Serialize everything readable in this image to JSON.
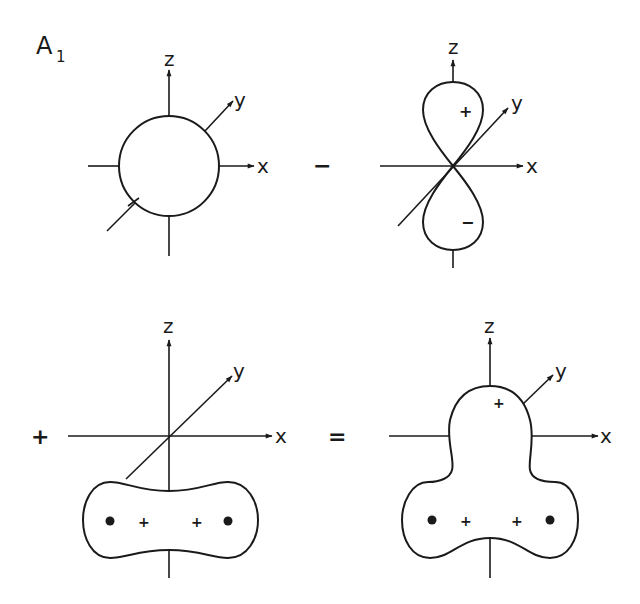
{
  "figure": {
    "label_main": "A",
    "label_sub": "1",
    "operators": {
      "minus": "−",
      "plus": "+",
      "equals": "="
    },
    "panels": [
      {
        "id": "s-orbital",
        "description": "spherical s-type orbital",
        "axes": {
          "z": "z",
          "y": "y",
          "x": "x"
        }
      },
      {
        "id": "pz-orbital",
        "description": "p_z orbital with + and − lobes",
        "axes": {
          "z": "z",
          "y": "y",
          "x": "x"
        },
        "lobe_signs": {
          "upper": "+",
          "lower": "−"
        }
      },
      {
        "id": "ligand-combination",
        "description": "ligand group orbital with two nuclei",
        "axes": {
          "z": "z",
          "y": "y",
          "x": "x"
        },
        "signs": [
          "+",
          "+"
        ],
        "nuclei_count": 2
      },
      {
        "id": "resulting-hybrid",
        "description": "resulting combined orbital",
        "axes": {
          "z": "z",
          "y": "y",
          "x": "x"
        },
        "signs": [
          "+",
          "+",
          "+"
        ],
        "nuclei_count": 2
      }
    ]
  },
  "colors": {
    "ink": "#1a1a1a",
    "background": "#ffffff"
  }
}
